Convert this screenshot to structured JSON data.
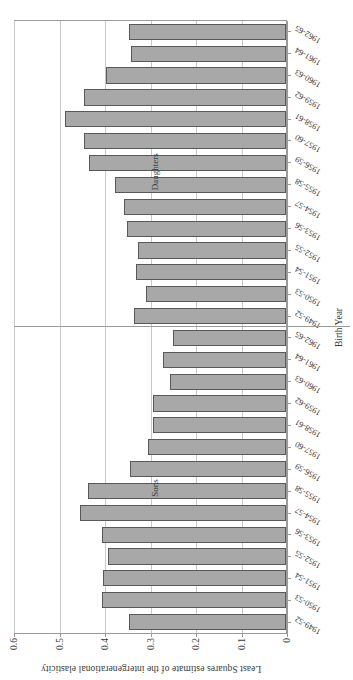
{
  "chart_data": {
    "type": "bar",
    "title": "",
    "xlabel": "Birth Year",
    "ylabel": "Least Squares estimate of the intergenerational elasticity",
    "orientation": "horizontal-rotated",
    "ylim": [
      0,
      0.6
    ],
    "ytick_labels": [
      "0",
      "0.1",
      "0.2",
      "0.3",
      "0.4",
      "0.5",
      "0.6"
    ],
    "ytick_values": [
      0,
      0.1,
      0.2,
      0.3,
      0.4,
      0.5,
      0.6
    ],
    "grid": true,
    "legend_position": "none",
    "bar_fill": "#a8a8a8",
    "bar_border": "#595959",
    "groups": [
      {
        "name": "Sons",
        "categories": [
          "1949-52",
          "1950-53",
          "1951-54",
          "1952-55",
          "1953-56",
          "1954-57",
          "1955-58",
          "1956-59",
          "1957-60",
          "1958-61",
          "1959-62",
          "1960-63",
          "1961-64",
          "1962-65"
        ],
        "values": [
          0.345,
          0.405,
          0.403,
          0.392,
          0.404,
          0.452,
          0.435,
          0.343,
          0.303,
          0.292,
          0.292,
          0.255,
          0.271,
          0.248
        ]
      },
      {
        "name": "Daughters",
        "categories": [
          "1949-52",
          "1950-53",
          "1951-54",
          "1952-55",
          "1953-56",
          "1954-57",
          "1955-58",
          "1956-59",
          "1957-60",
          "1958-61",
          "1959-62",
          "1960-63",
          "1961-64",
          "1962-65"
        ],
        "values": [
          0.334,
          0.307,
          0.33,
          0.326,
          0.35,
          0.357,
          0.376,
          0.432,
          0.444,
          0.485,
          0.444,
          0.396,
          0.341,
          0.344
        ]
      }
    ]
  }
}
